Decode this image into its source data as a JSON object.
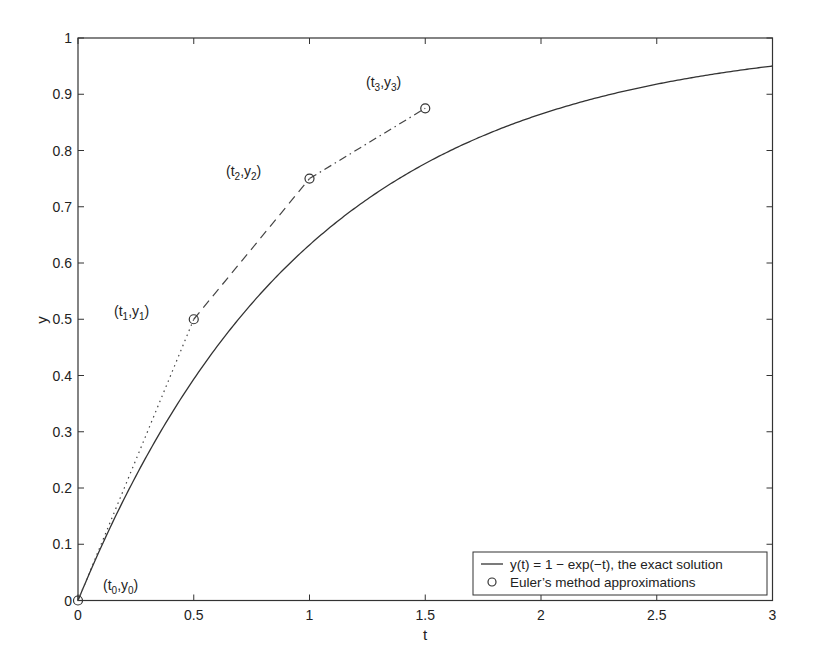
{
  "chart_data": {
    "type": "line",
    "title": "",
    "xlabel": "t",
    "ylabel": "y",
    "xlim": [
      0,
      3
    ],
    "ylim": [
      0,
      1
    ],
    "grid": false,
    "legend_position": "lower right",
    "x_ticks": [
      0,
      0.5,
      1,
      1.5,
      2,
      2.5,
      3
    ],
    "x_tick_labels": [
      "0",
      "0.5",
      "1",
      "1.5",
      "2",
      "2.5",
      "3"
    ],
    "y_ticks": [
      0,
      0.1,
      0.2,
      0.3,
      0.4,
      0.5,
      0.6,
      0.7,
      0.8,
      0.9,
      1
    ],
    "y_tick_labels": [
      "0",
      "0.1",
      "0.2",
      "0.3",
      "0.4",
      "0.5",
      "0.6",
      "0.7",
      "0.8",
      "0.9",
      "1"
    ],
    "series": [
      {
        "name": "y(t) = 1 − exp(−t), the exact solution",
        "style": "solid",
        "marker": "none",
        "function": "1 - exp(-t)",
        "x": [
          0,
          0.25,
          0.5,
          0.75,
          1,
          1.25,
          1.5,
          1.75,
          2,
          2.25,
          2.5,
          2.75,
          3
        ],
        "values": [
          0,
          0.221,
          0.393,
          0.528,
          0.632,
          0.713,
          0.777,
          0.826,
          0.865,
          0.895,
          0.918,
          0.936,
          0.95
        ]
      },
      {
        "name": "Euler's method approximations",
        "style": "markers",
        "marker": "circle",
        "x": [
          0,
          0.5,
          1,
          1.5
        ],
        "values": [
          0,
          0.5,
          0.75,
          0.875
        ]
      }
    ],
    "connecting_segments": [
      {
        "from": [
          0,
          0
        ],
        "to": [
          0.5,
          0.5
        ],
        "style": "dotted"
      },
      {
        "from": [
          0.5,
          0.5
        ],
        "to": [
          1,
          0.75
        ],
        "style": "dashed"
      },
      {
        "from": [
          1,
          0.75
        ],
        "to": [
          1.5,
          0.875
        ],
        "style": "dash-dot"
      }
    ],
    "annotations": [
      {
        "text": "(t0,y0)",
        "base": [
          "t",
          "y"
        ],
        "sub": "0",
        "x": 0,
        "y": 0
      },
      {
        "text": "(t1,y1)",
        "base": [
          "t",
          "y"
        ],
        "sub": "1",
        "x": 0.5,
        "y": 0.5
      },
      {
        "text": "(t2,y2)",
        "base": [
          "t",
          "y"
        ],
        "sub": "2",
        "x": 1,
        "y": 0.75
      },
      {
        "text": "(t3,y3)",
        "base": [
          "t",
          "y"
        ],
        "sub": "3",
        "x": 1.5,
        "y": 0.875
      }
    ]
  },
  "legend": {
    "items": [
      {
        "label": "y(t) = 1 − exp(−t), the exact solution",
        "symbol": "line"
      },
      {
        "label": "Euler’s method approximations",
        "symbol": "circle"
      }
    ]
  },
  "labels": {
    "t0": {
      "open": "(t",
      "sub1": "0",
      "mid": ",y",
      "sub2": "0",
      "close": ")"
    },
    "t1": {
      "open": "(t",
      "sub1": "1",
      "mid": ",y",
      "sub2": "1",
      "close": ")"
    },
    "t2": {
      "open": "(t",
      "sub1": "2",
      "mid": ",y",
      "sub2": "2",
      "close": ")"
    },
    "t3": {
      "open": "(t",
      "sub1": "3",
      "mid": ",y",
      "sub2": "3",
      "close": ")"
    }
  },
  "colors": {
    "axis": "#333333",
    "line": "#333333",
    "background": "#ffffff"
  }
}
